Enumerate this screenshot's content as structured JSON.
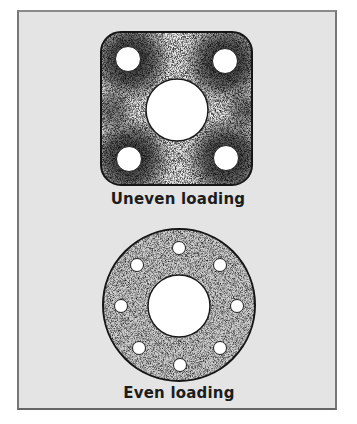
{
  "figures": [
    {
      "id": "square-flange",
      "shape": "rounded-square",
      "caption": "Uneven loading",
      "bolt_holes": 4,
      "center_hole": true,
      "shading": "dark concentrations around bolt holes"
    },
    {
      "id": "round-flange",
      "shape": "circle",
      "caption": "Even loading",
      "bolt_holes": 8,
      "center_hole": true,
      "shading": "uniform speckle"
    }
  ],
  "colors": {
    "background_panel": "#e4e4e4",
    "flange_outline": "#1a1a1a",
    "holes": "#ffffff",
    "text": "#1c1c1c"
  }
}
